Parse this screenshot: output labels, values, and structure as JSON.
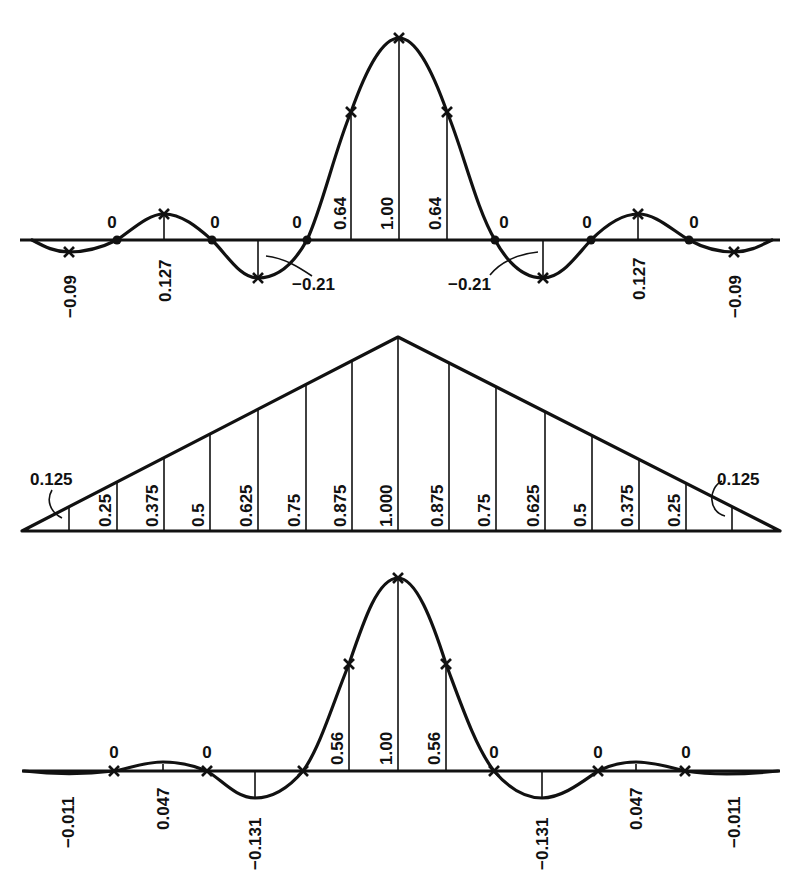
{
  "diagram": {
    "colors": {
      "ink": "#111111",
      "background": "#ffffff"
    }
  },
  "panels": {
    "top": {
      "name": "sinc-kernel",
      "labels": {
        "neg009_left": "−0.09",
        "zero1": "0",
        "v0127_left": "0.127",
        "zero2": "0",
        "neg021_left": "−0.21",
        "zero3": "0",
        "v064_left": "0.64",
        "v100": "1.00",
        "v064_right": "0.64",
        "zero4": "0",
        "neg021_right": "−0.21",
        "zero5": "0",
        "v0127_right": "0.127",
        "zero6": "0",
        "neg009_right": "−0.09"
      }
    },
    "middle": {
      "name": "triangle-window",
      "labels": {
        "l0125": "0.125",
        "l025": "0.25",
        "l0375": "0.375",
        "l05": "0.5",
        "l0625": "0.625",
        "l075": "0.75",
        "l0875": "0.875",
        "c1000": "1.000",
        "r0875": "0.875",
        "r075": "0.75",
        "r0625": "0.625",
        "r05": "0.5",
        "r0375": "0.375",
        "r025": "0.25",
        "r0125": "0.125"
      }
    },
    "bottom": {
      "name": "windowed-kernel",
      "labels": {
        "neg0011_left": "−0.011",
        "zero1": "0",
        "v0047_left": "0.047",
        "zero2": "0",
        "neg0131_left": "−0.131",
        "v056_left": "0.56",
        "v100": "1.00",
        "v056_right": "0.56",
        "zero3": "0",
        "neg0131_right": "−0.131",
        "zero4": "0",
        "v0047_right": "0.047",
        "zero5": "0",
        "neg0011_right": "−0.011"
      }
    }
  }
}
